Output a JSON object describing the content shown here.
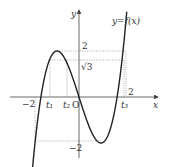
{
  "diagram": {
    "function_label": "y=f(x)",
    "axes": {
      "x_label": "x",
      "y_label": "y",
      "origin_label": "O"
    },
    "x_ticks": [
      {
        "label": "−2",
        "value": -2
      },
      {
        "label": "t₁",
        "value": -1.68
      },
      {
        "label": "t₂",
        "value": -0.54
      },
      {
        "label": "t₃",
        "value": 2
      }
    ],
    "y_ticks": [
      {
        "label": "2",
        "value": 2
      },
      {
        "label": "√3",
        "value": 1.732
      },
      {
        "label": "−2",
        "value": -2
      }
    ],
    "right_label_2": "2",
    "colors": {
      "curve": "#222222",
      "axis": "#444444",
      "guide": "#888888"
    }
  }
}
